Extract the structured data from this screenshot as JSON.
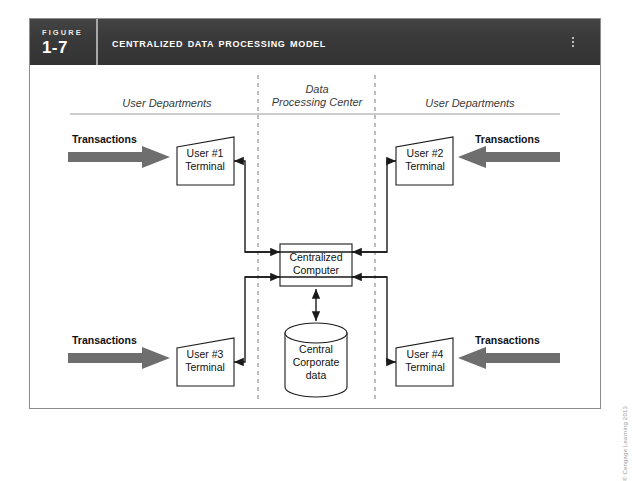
{
  "figure": {
    "label_word": "FIGURE",
    "number": "1-7",
    "title": "Centralized Data Processing Model"
  },
  "columns": {
    "left": "User Departments",
    "center_line1": "Data",
    "center_line2": "Processing Center",
    "right": "User Departments"
  },
  "nodes": {
    "terminal1_line1": "User #1",
    "terminal1_line2": "Terminal",
    "terminal2_line1": "User #2",
    "terminal2_line2": "Terminal",
    "terminal3_line1": "User #3",
    "terminal3_line2": "Terminal",
    "terminal4_line1": "User #4",
    "terminal4_line2": "Terminal",
    "computer_line1": "Centralized",
    "computer_line2": "Computer",
    "database_line1": "Central",
    "database_line2": "Corporate",
    "database_line3": "data"
  },
  "transactions": {
    "top_left": "Transactions",
    "top_right": "Transactions",
    "bottom_left": "Transactions",
    "bottom_right": "Transactions"
  },
  "copyright": "© Cengage Learning 2013",
  "colors": {
    "header_bar": "#3b3b3b",
    "frame_border": "#8d8d8d",
    "arrow_fill": "#6e6e6e",
    "line": "#1a1a1a",
    "divider": "#9a9a9a",
    "background": "#ffffff"
  }
}
